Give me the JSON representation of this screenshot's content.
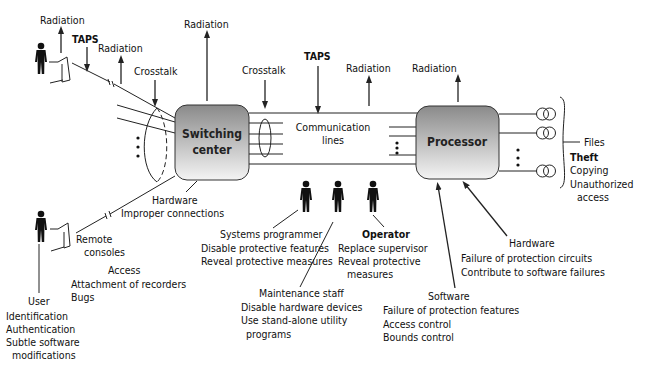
{
  "diagram": {
    "colors": {
      "ink": "#111111",
      "box_top": "#8a8a8a",
      "box_bottom": "#f4f4f4"
    },
    "nodes": {
      "switching_center": {
        "line1": "Switching",
        "line2": "center"
      },
      "communication_lines": {
        "line1": "Communication",
        "line2": "lines"
      },
      "processor": {
        "label": "Processor"
      },
      "files": {
        "label": "Files",
        "threats": [
          "Theft",
          "Copying",
          "Unauthorized",
          "access"
        ]
      }
    },
    "threat_labels": {
      "radiation": "Radiation",
      "taps": "TAPS",
      "crosstalk": "Crosstalk"
    },
    "actors": {
      "remote_consoles": {
        "line1": "Remote",
        "line2": "consoles"
      },
      "user": {
        "label": "User",
        "threats": [
          "Identification",
          "Authentication",
          "Subtle software",
          "modifications"
        ]
      },
      "access": {
        "label": "Access",
        "threats": [
          "Attachment of recorders",
          "Bugs"
        ]
      },
      "hardware_switch": {
        "label": "Hardware",
        "threats": [
          "Improper connections"
        ]
      },
      "systems_programmer": {
        "label": "Systems programmer",
        "threats": [
          "Disable protective features",
          "Reveal protective measures"
        ]
      },
      "maintenance_staff": {
        "label": "Maintenance staff",
        "threats": [
          "Disable hardware devices",
          "Use stand-alone utility",
          "programs"
        ]
      },
      "operator": {
        "label": "Operator",
        "threats": [
          "Replace supervisor",
          "Reveal protective",
          "measures"
        ]
      },
      "software": {
        "label": "Software",
        "threats": [
          "Failure of protection features",
          "Access control",
          "Bounds control"
        ]
      },
      "hardware_processor": {
        "label": "Hardware",
        "threats": [
          "Failure of protection circuits",
          "Contribute to software failures"
        ]
      }
    },
    "icons": [
      "person-icon",
      "terminal-icon",
      "disk-icon",
      "arrow-up-icon",
      "arrow-down-icon"
    ]
  }
}
